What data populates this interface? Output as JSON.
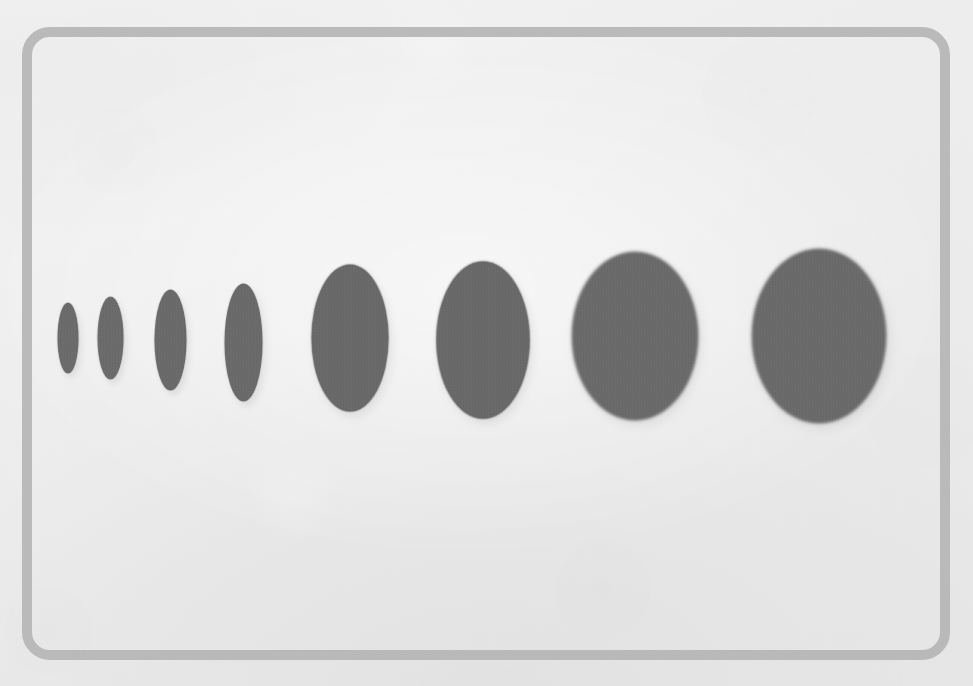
{
  "canvas": {
    "width": 973,
    "height": 686,
    "background_color": "#efefef",
    "paper_tint": "#eeeeee"
  },
  "frame": {
    "name": "rounded-rectangle-border",
    "stroke_color": "#b5b5b5",
    "stroke_width": 10,
    "corner_radius": 28,
    "left": 22,
    "top": 27,
    "width": 928,
    "height": 633
  },
  "figure": {
    "title": "",
    "caption": "",
    "shape_fill_color": "#6a6a6a",
    "shape_count": 8,
    "baseline_center_y": 337
  },
  "chart_data": {
    "type": "scatter",
    "title": "",
    "subtitle": "",
    "xlabel": "",
    "ylabel": "",
    "grid": false,
    "legend_position": "none",
    "categories": [
      "1",
      "2",
      "3",
      "4",
      "5",
      "6",
      "7",
      "8"
    ],
    "series": [
      {
        "name": "width_px",
        "values": [
          20,
          25,
          31,
          37,
          76,
          92,
          124,
          132
        ]
      },
      {
        "name": "height_px",
        "values": [
          70,
          82,
          100,
          117,
          146,
          156,
          166,
          172
        ]
      },
      {
        "name": "center_x_px",
        "values": [
          68,
          110,
          170,
          243,
          350,
          483,
          635,
          819
        ]
      },
      {
        "name": "center_y_px",
        "values": [
          338,
          338,
          340,
          342,
          338,
          340,
          336,
          336
        ]
      },
      {
        "name": "aspect_ratio",
        "values": [
          0.29,
          0.3,
          0.31,
          0.32,
          0.52,
          0.59,
          0.75,
          0.77
        ]
      }
    ],
    "shapes": [
      {
        "label": "ellipse-1",
        "cx": 68,
        "cy": 338,
        "w": 20,
        "h": 70,
        "aspect": 0.29,
        "fill": "#6b6b6b"
      },
      {
        "label": "ellipse-2",
        "cx": 110,
        "cy": 338,
        "w": 25,
        "h": 82,
        "aspect": 0.3,
        "fill": "#6b6b6b"
      },
      {
        "label": "ellipse-3",
        "cx": 170,
        "cy": 340,
        "w": 31,
        "h": 100,
        "aspect": 0.31,
        "fill": "#6a6a6a"
      },
      {
        "label": "ellipse-4",
        "cx": 243,
        "cy": 342,
        "w": 37,
        "h": 117,
        "aspect": 0.32,
        "fill": "#6a6a6a"
      },
      {
        "label": "ellipse-5",
        "cx": 350,
        "cy": 338,
        "w": 76,
        "h": 146,
        "aspect": 0.52,
        "fill": "#696969"
      },
      {
        "label": "ellipse-6",
        "cx": 483,
        "cy": 340,
        "w": 92,
        "h": 156,
        "aspect": 0.59,
        "fill": "#696969"
      },
      {
        "label": "ellipse-7",
        "cx": 635,
        "cy": 336,
        "w": 124,
        "h": 166,
        "aspect": 0.75,
        "fill": "#6a6a6a"
      },
      {
        "label": "ellipse-8",
        "cx": 819,
        "cy": 336,
        "w": 132,
        "h": 172,
        "aspect": 0.77,
        "fill": "#6a6a6a"
      }
    ],
    "xlim": [
      0,
      973
    ],
    "ylim": [
      0,
      686
    ]
  }
}
